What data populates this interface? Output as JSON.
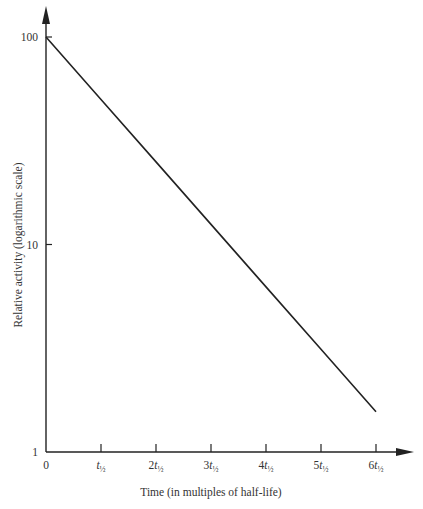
{
  "chart_data": {
    "type": "line",
    "title": "",
    "xlabel": "Time (in multiples of half-life)",
    "ylabel": "Relative activity (logarithmic scale)",
    "yscale": "log",
    "ylim": [
      1,
      100
    ],
    "xlim": [
      0,
      6
    ],
    "grid": false,
    "legend": null,
    "x_ticks": [
      {
        "value": 0,
        "label": "0"
      },
      {
        "value": 1,
        "label": "t½"
      },
      {
        "value": 2,
        "label": "2t½"
      },
      {
        "value": 3,
        "label": "3t½"
      },
      {
        "value": 4,
        "label": "4t½"
      },
      {
        "value": 5,
        "label": "5t½"
      },
      {
        "value": 6,
        "label": "6t½"
      }
    ],
    "y_ticks": [
      {
        "value": 1,
        "label": "1"
      },
      {
        "value": 10,
        "label": "10"
      },
      {
        "value": 100,
        "label": "100"
      }
    ],
    "series": [
      {
        "name": "Relative activity",
        "x": [
          0,
          1,
          2,
          3,
          4,
          5,
          6
        ],
        "values": [
          100,
          50,
          25,
          12.5,
          6.25,
          3.125,
          1.5625
        ]
      }
    ],
    "color": "#222222"
  }
}
